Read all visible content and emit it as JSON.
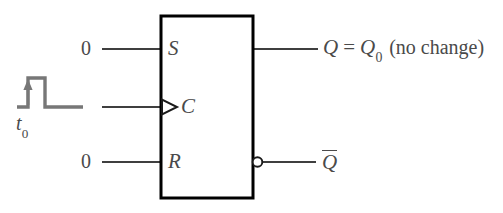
{
  "figure": {
    "type": "logic-diagram",
    "colors": {
      "background": "#ffffff",
      "box_outline": "#000000",
      "signal_line": "#3f3f3f",
      "text": "#4a4a4a",
      "waveform": "#777777"
    }
  },
  "block": {
    "name": "flip-flop-body",
    "x": 161,
    "y": 16,
    "width": 92,
    "height": 182
  },
  "inputs": [
    {
      "pin_label": "S",
      "value_label": "0",
      "line_y": 49,
      "line_x1": 102,
      "line_x2": 161
    },
    {
      "pin_label": "C",
      "value_label": "",
      "line_y": 107,
      "line_x1": 102,
      "line_x2": 161,
      "dynamic_indicator": true
    },
    {
      "pin_label": "R",
      "value_label": "0",
      "line_y": 162,
      "line_x1": 102,
      "line_x2": 161
    }
  ],
  "outputs": [
    {
      "name": "q-output",
      "symbol": "Q",
      "equals": "=",
      "value_symbol": "Q",
      "value_subscript": "0",
      "note": "(no change)",
      "full_text": "Q = Q0 (no change)",
      "line_y": 49,
      "line_x1": 253,
      "line_x2": 318,
      "inverted": false
    },
    {
      "name": "qbar-output",
      "symbol": "Q",
      "overbar": true,
      "full_text": "Q̅",
      "line_y": 162,
      "line_x1": 262,
      "line_x2": 316,
      "inverted": true,
      "bubble_cx": 257.5,
      "bubble_cy": 162,
      "bubble_r": 4.8
    }
  ],
  "waveform": {
    "name": "clock-pulse",
    "label": "t",
    "label_subscript": "0",
    "label_text": "t0",
    "baseline_y": 107,
    "high_y": 78,
    "start_x": 17,
    "rise_x": 28,
    "fall_x": 45,
    "end_x": 83,
    "arrow": {
      "direction": "up",
      "x": 28,
      "from_y": 104,
      "to_y": 83
    }
  }
}
